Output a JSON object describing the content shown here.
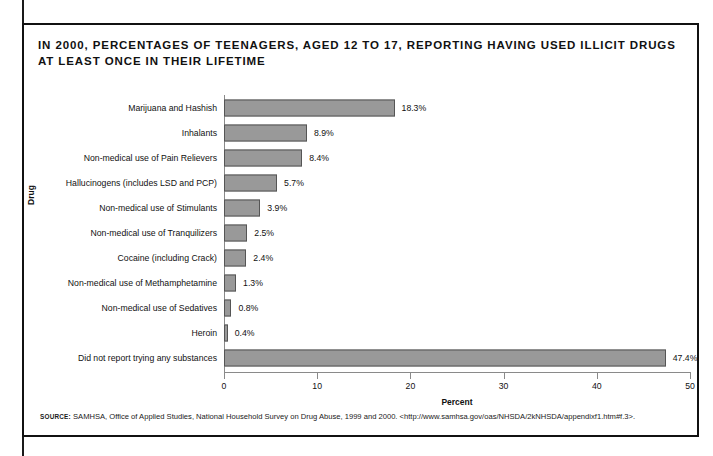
{
  "figure": {
    "title": "IN 2000, PERCENTAGES OF TEENAGERS, AGED 12 TO 17, REPORTING HAVING USED ILLICIT DRUGS AT LEAST ONCE IN THEIR LIFETIME",
    "source_label": "SOURCE:",
    "source_text": "SAMHSA, Office of Applied Studies, National Household Survey on Drug Abuse, 1999 and 2000. <http://www.samhsa.gov/oas/NHSDA/2kNHSDA/appendixf1.htm#f.3>."
  },
  "chart_data": {
    "type": "bar",
    "orientation": "horizontal",
    "title": "IN 2000, PERCENTAGES OF TEENAGERS, AGED 12 TO 17, REPORTING HAVING USED ILLICIT DRUGS AT LEAST ONCE IN THEIR LIFETIME",
    "xlabel": "Percent",
    "ylabel": "Drug",
    "xlim": [
      0,
      50
    ],
    "xticks": [
      0,
      10,
      20,
      30,
      40,
      50
    ],
    "xtick_labels": [
      "0",
      "10",
      "20",
      "30",
      "40",
      "50"
    ],
    "grid": false,
    "legend": false,
    "bar_color": "#999999",
    "bar_border_color": "#555555",
    "categories": [
      "Marijuana and Hashish",
      "Inhalants",
      "Non-medical use of Pain Relievers",
      "Hallucinogens (includes LSD and PCP)",
      "Non-medical use of Stimulants",
      "Non-medical use of Tranquilizers",
      "Cocaine (including Crack)",
      "Non-medical use of Methamphetamine",
      "Non-medical use of Sedatives",
      "Heroin",
      "Did not report trying any substances"
    ],
    "values": [
      18.3,
      8.9,
      8.4,
      5.7,
      3.9,
      2.5,
      2.4,
      1.3,
      0.8,
      0.4,
      47.4
    ],
    "value_labels": [
      "18.3%",
      "8.9%",
      "8.4%",
      "5.7%",
      "3.9%",
      "2.5%",
      "2.4%",
      "1.3%",
      "0.8%",
      "0.4%",
      "47.4%"
    ]
  }
}
